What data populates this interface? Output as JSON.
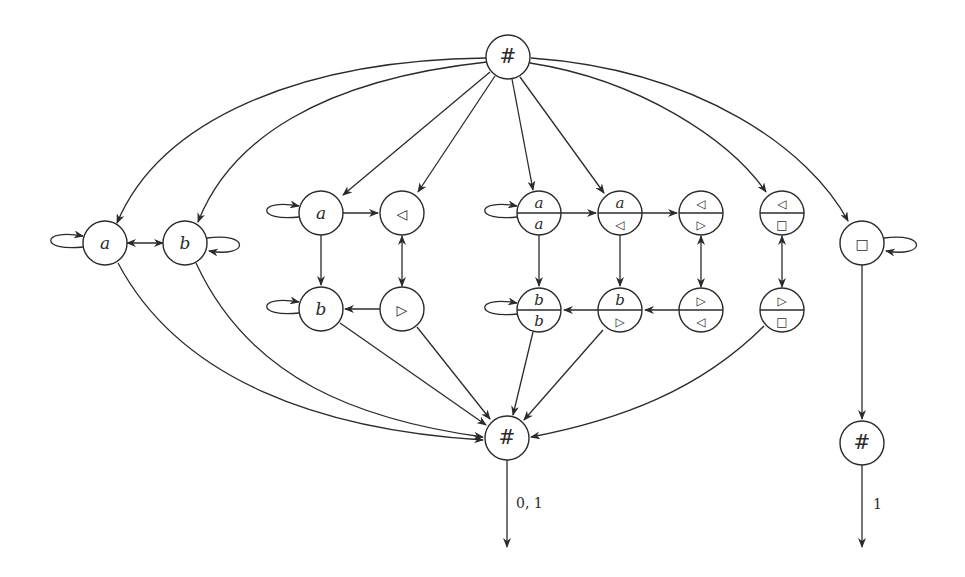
{
  "diagram": {
    "colors": {
      "stroke": "#2b2b2b",
      "background": "#ffffff",
      "node_fill": "#ffffff"
    },
    "node_radius": 22,
    "nodes": [
      {
        "id": "top_hash",
        "x": 508,
        "y": 57,
        "type": "single",
        "label": "#",
        "style": "hash"
      },
      {
        "id": "a_left",
        "x": 105,
        "y": 243,
        "type": "single",
        "label": "a",
        "style": "italic"
      },
      {
        "id": "b_left",
        "x": 185,
        "y": 243,
        "type": "single",
        "label": "b",
        "style": "italic"
      },
      {
        "id": "g_a",
        "x": 321,
        "y": 213,
        "type": "single",
        "label": "a",
        "style": "italic"
      },
      {
        "id": "g_lt",
        "x": 402,
        "y": 213,
        "type": "single",
        "label": "◁",
        "style": "sym"
      },
      {
        "id": "g_b",
        "x": 321,
        "y": 309,
        "type": "single",
        "label": "b",
        "style": "italic"
      },
      {
        "id": "g_rt",
        "x": 402,
        "y": 309,
        "type": "single",
        "label": "▷",
        "style": "sym"
      },
      {
        "id": "s_aa",
        "x": 539,
        "y": 213,
        "type": "split",
        "top": "a",
        "bottom": "a",
        "top_style": "italic",
        "bottom_style": "italic"
      },
      {
        "id": "s_alt",
        "x": 620,
        "y": 213,
        "type": "split",
        "top": "a",
        "bottom": "◁",
        "top_style": "italic",
        "bottom_style": "sym"
      },
      {
        "id": "s_ltrt",
        "x": 701,
        "y": 213,
        "type": "split",
        "top": "◁",
        "bottom": "▷",
        "top_style": "sym",
        "bottom_style": "sym"
      },
      {
        "id": "s_ltsq",
        "x": 782,
        "y": 213,
        "type": "split",
        "top": "◁",
        "bottom": "□",
        "top_style": "sym",
        "bottom_style": "sym"
      },
      {
        "id": "s_bb",
        "x": 539,
        "y": 310,
        "type": "split",
        "top": "b",
        "bottom": "b",
        "top_style": "italic",
        "bottom_style": "italic"
      },
      {
        "id": "s_brt",
        "x": 620,
        "y": 310,
        "type": "split",
        "top": "b",
        "bottom": "▷",
        "top_style": "italic",
        "bottom_style": "sym"
      },
      {
        "id": "s_rtlt",
        "x": 701,
        "y": 310,
        "type": "split",
        "top": "▷",
        "bottom": "◁",
        "top_style": "sym",
        "bottom_style": "sym"
      },
      {
        "id": "s_rtsq",
        "x": 782,
        "y": 310,
        "type": "split",
        "top": "▷",
        "bottom": "□",
        "top_style": "sym",
        "bottom_style": "sym"
      },
      {
        "id": "sq",
        "x": 862,
        "y": 243,
        "type": "single",
        "label": "□",
        "style": "sym"
      },
      {
        "id": "bottom_hash",
        "x": 507,
        "y": 438,
        "type": "single",
        "label": "#",
        "style": "hash"
      },
      {
        "id": "right_hash",
        "x": 862,
        "y": 443,
        "type": "single",
        "label": "#",
        "style": "hash"
      }
    ],
    "edges": [
      {
        "d": "M 486 58 C 300 60, 160 120, 117 223",
        "end": "a_left"
      },
      {
        "d": "M 487 62 C 320 80, 230 140, 198 222",
        "end": "b_left"
      },
      {
        "d": "M 490 72 L 343 195",
        "end": "g_a"
      },
      {
        "d": "M 495 76 L 418 192",
        "end": "g_lt"
      },
      {
        "d": "M 512 79 L 533 190",
        "end": "s_aa"
      },
      {
        "d": "M 520 77 L 604 193",
        "end": "s_alt"
      },
      {
        "d": "M 530 63 C 640 80, 730 140, 766 192",
        "end": "s_ltsq"
      },
      {
        "d": "M 531 58 C 700 70, 810 150, 848 221",
        "end": "sq"
      },
      {
        "d": "M 127 243 L 163 243",
        "end": "b_left",
        "start_arrow": true
      },
      {
        "d": "M 343 213 L 378 213",
        "end": "g_lt"
      },
      {
        "d": "M 321 235 L 321 285",
        "end": "g_b"
      },
      {
        "d": "M 402 236 L 402 286",
        "end": "g_rt",
        "start_arrow": true
      },
      {
        "d": "M 380 309 L 345 309",
        "end": "g_b"
      },
      {
        "d": "M 561 213 L 596 213",
        "end": "s_alt"
      },
      {
        "d": "M 642 213 L 677 213",
        "end": "s_ltrt"
      },
      {
        "d": "M 539 235 L 539 286",
        "end": "s_bb"
      },
      {
        "d": "M 620 235 L 620 286",
        "end": "s_brt"
      },
      {
        "d": "M 701 236 L 701 287",
        "end": "s_rtlt",
        "start_arrow": true
      },
      {
        "d": "M 782 236 L 782 287",
        "end": "s_rtsq",
        "start_arrow": true
      },
      {
        "d": "M 679 310 L 645 310",
        "end": "s_brt"
      },
      {
        "d": "M 598 310 L 564 310",
        "end": "s_bb"
      },
      {
        "d": "M 118 263 C 180 380, 320 430, 483 440",
        "end": "bottom_hash"
      },
      {
        "d": "M 196 263 C 250 380, 360 420, 483 437",
        "end": "bottom_hash"
      },
      {
        "d": "M 340 323 L 486 425",
        "end": "bottom_hash"
      },
      {
        "d": "M 417 327 L 490 419",
        "end": "bottom_hash"
      },
      {
        "d": "M 533 332 L 513 415",
        "end": "bottom_hash"
      },
      {
        "d": "M 603 330 L 524 420",
        "end": "bottom_hash"
      },
      {
        "d": "M 764 326 C 700 390, 620 420, 531 437",
        "end": "bottom_hash"
      },
      {
        "d": "M 862 265 L 862 419",
        "end": "right_hash"
      },
      {
        "d": "M 507 460 L 507 547",
        "end": "out1"
      },
      {
        "d": "M 862 465 L 862 547",
        "end": "out2"
      }
    ],
    "self_loops": [
      {
        "d": "M 83 247 C 40 252, 40 228, 83 236",
        "side": "left",
        "node": "a_left"
      },
      {
        "d": "M 207 238 C 250 232, 250 258, 209 251",
        "side": "right",
        "node": "b_left"
      },
      {
        "d": "M 299 217 C 256 222, 256 198, 299 206",
        "side": "left",
        "node": "g_a"
      },
      {
        "d": "M 299 313 C 256 318, 256 294, 299 302",
        "side": "left",
        "node": "g_b"
      },
      {
        "d": "M 517 217 C 474 222, 474 198, 517 206",
        "side": "left",
        "node": "s_aa"
      },
      {
        "d": "M 517 314 C 474 319, 474 295, 517 303",
        "side": "left",
        "node": "s_bb"
      },
      {
        "d": "M 884 238 C 927 232, 927 258, 886 251",
        "side": "right",
        "node": "sq"
      }
    ],
    "edge_labels": [
      {
        "text": "0, 1",
        "x": 516,
        "y": 508
      },
      {
        "text": "1",
        "x": 873,
        "y": 509
      }
    ]
  }
}
